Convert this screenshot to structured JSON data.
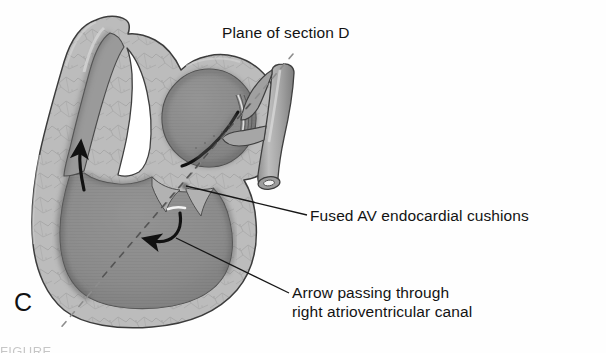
{
  "figure": {
    "panel_letter": "C",
    "alt_summary": "Grayscale anatomical drawing of an embryonic heart sectioned to show the atrium, ventricle, outflow tract and fused atrioventricular endocardial cushions",
    "background_color": "#ffffff",
    "ink_color": "#131313",
    "wall_color": "#b6b6b6",
    "wall_light_color": "#c6c6c6",
    "lumen_color": "#8d8d8d",
    "lumen_dark_color": "#6f6f6f",
    "outline_color": "#3a3a3a",
    "shadow_color": "#5c5c5c",
    "vessel_color": "#a9a9a9",
    "highlight_color": "#ffffff"
  },
  "labels": {
    "plane_of_section": "Plane of section D",
    "fused_cushions": "Fused AV endocardial cushions",
    "arrow_canal_line1": "Arrow passing through",
    "arrow_canal_line2": "right atrioventricular canal"
  },
  "annotations": {
    "section_plane_style": "dashed",
    "leader_line_style": "solid",
    "flow_arrow_count": 2,
    "flow_arrows": [
      {
        "name": "ventricle-inflow-arrow",
        "direction": "upward-curving"
      },
      {
        "name": "av-canal-arrow",
        "direction": "down-left hook"
      }
    ]
  },
  "footer": {
    "cut_off_caption": "FIGURE"
  }
}
